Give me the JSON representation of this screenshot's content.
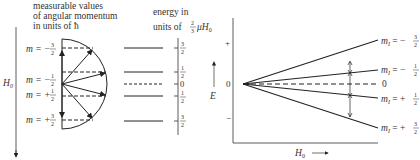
{
  "left_panel": {
    "caption_lines": [
      "measurable values",
      "of angular momentum",
      "in units of ħ"
    ],
    "axis_label": "H",
    "axis_label_sub": "0",
    "m_labels": [
      {
        "text": "m = −",
        "num": "3",
        "den": "2"
      },
      {
        "text": "m = −",
        "num": "1",
        "den": "2"
      },
      {
        "text": "m = +",
        "num": "1",
        "den": "2"
      },
      {
        "text": "m = +",
        "num": "3",
        "den": "2"
      }
    ]
  },
  "middle_panel": {
    "caption_line1": "energy in",
    "caption_line2_prefix": "units of ",
    "caption_frac_num": "2",
    "caption_frac_den": "3",
    "caption_line2_suffix": "μH",
    "caption_sub": "0",
    "levels": [
      {
        "num": "3",
        "den": "2"
      },
      {
        "num": "1",
        "den": "2"
      },
      {
        "zero": "0"
      },
      {
        "num": "1",
        "den": "2"
      },
      {
        "num": "3",
        "den": "2"
      }
    ],
    "energy_axis_label": "E"
  },
  "right_panel": {
    "plus_label": "+",
    "zero_label": "0",
    "minus_label": "−",
    "x_axis_label": "H",
    "x_axis_sub": "0",
    "lines": [
      {
        "label": "m",
        "sub": "I",
        "sign": " = −",
        "num": "3",
        "den": "2"
      },
      {
        "label": "m",
        "sub": "I",
        "sign": " = −",
        "num": "1",
        "den": "2"
      },
      {
        "zero": "0"
      },
      {
        "label": "m",
        "sub": "I",
        "sign": " = +",
        "num": "1",
        "den": "2"
      },
      {
        "label": "m",
        "sub": "I",
        "sign": " = +",
        "num": "3",
        "den": "2"
      }
    ]
  }
}
